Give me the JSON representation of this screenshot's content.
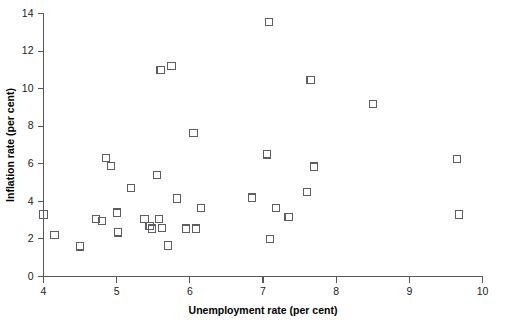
{
  "chart_data": {
    "type": "scatter",
    "title": "",
    "xlabel": "Unemployment rate (per cent)",
    "ylabel": "Inflation rate (per cent)",
    "xlim": [
      4,
      10
    ],
    "ylim": [
      0,
      14
    ],
    "xticks": [
      4,
      5,
      6,
      7,
      8,
      9,
      10
    ],
    "xtick_labels": [
      "4",
      "5",
      "6",
      "7",
      "8",
      "9",
      "10"
    ],
    "yticks": [
      0,
      2,
      4,
      6,
      8,
      10,
      12,
      14
    ],
    "ytick_labels": [
      "0",
      "2",
      "4",
      "6",
      "8",
      "10",
      "12",
      "14"
    ],
    "grid": false,
    "legend": null,
    "marker": "open-square",
    "marker_color": "#5c5e61",
    "series": [
      {
        "name": "Unemployment vs Inflation",
        "points": [
          [
            4.0,
            3.3
          ],
          [
            4.15,
            2.2
          ],
          [
            4.5,
            1.6
          ],
          [
            4.72,
            3.05
          ],
          [
            4.8,
            2.95
          ],
          [
            4.85,
            6.3
          ],
          [
            4.92,
            5.9
          ],
          [
            5.0,
            3.4
          ],
          [
            5.02,
            2.35
          ],
          [
            5.2,
            4.7
          ],
          [
            5.38,
            3.05
          ],
          [
            5.45,
            2.7
          ],
          [
            5.48,
            2.55
          ],
          [
            5.55,
            5.4
          ],
          [
            5.58,
            3.05
          ],
          [
            5.6,
            11.0
          ],
          [
            5.62,
            2.6
          ],
          [
            5.7,
            1.65
          ],
          [
            5.75,
            11.2
          ],
          [
            5.82,
            4.15
          ],
          [
            5.95,
            2.55
          ],
          [
            6.05,
            7.65
          ],
          [
            6.08,
            2.55
          ],
          [
            6.15,
            3.65
          ],
          [
            6.85,
            4.2
          ],
          [
            7.05,
            6.5
          ],
          [
            7.08,
            13.55
          ],
          [
            7.1,
            2.0
          ],
          [
            7.18,
            3.65
          ],
          [
            7.35,
            3.15
          ],
          [
            7.6,
            4.5
          ],
          [
            7.65,
            10.45
          ],
          [
            7.7,
            5.85
          ],
          [
            8.5,
            9.2
          ],
          [
            9.65,
            6.25
          ],
          [
            9.68,
            3.3
          ]
        ]
      }
    ]
  },
  "axes": {
    "x_title": "Unemployment rate (per cent)",
    "y_title": "Inflation rate (per cent)"
  }
}
